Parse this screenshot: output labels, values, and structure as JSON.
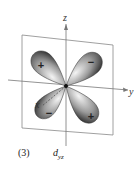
{
  "figure": {
    "number": "(3)",
    "orbital_symbol": "d",
    "orbital_subscript": "yz"
  },
  "axes": {
    "z_label": "z",
    "y_label": "y",
    "x_label": "x"
  },
  "lobes": [
    {
      "position": "upper-left",
      "sign": "+"
    },
    {
      "position": "upper-right",
      "sign": "−"
    },
    {
      "position": "lower-left",
      "sign": "−"
    },
    {
      "position": "lower-right",
      "sign": "+"
    }
  ],
  "colors": {
    "lobe_dark": "#3a3a3a",
    "lobe_light": "#e8e8e8",
    "line": "#777777"
  }
}
